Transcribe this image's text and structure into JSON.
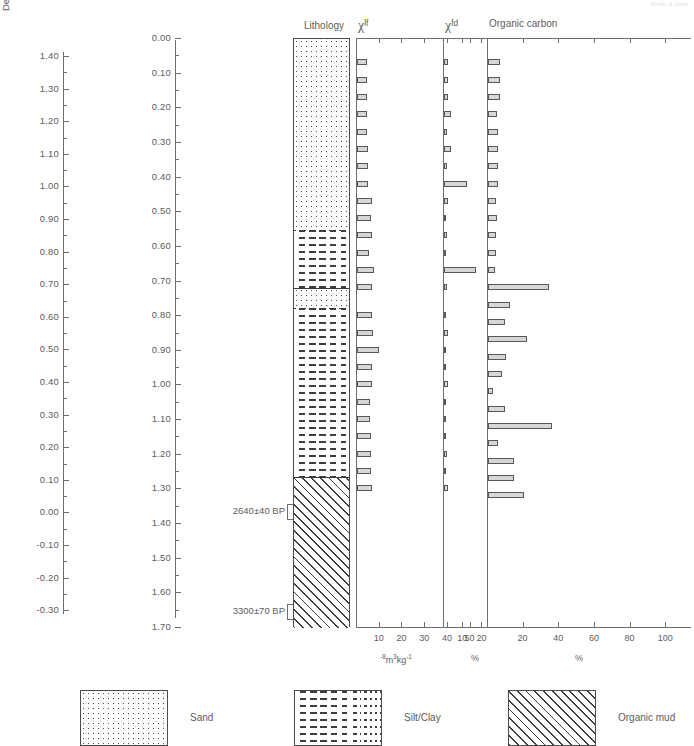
{
  "figure": {
    "corner_note": "Shelfy & Solm"
  },
  "axis_left": {
    "title": "Depth (m OD)",
    "ticks": [
      "1.40",
      "1.30",
      "1.20",
      "1.10",
      "1.00",
      "0.90",
      "0.80",
      "0.70",
      "0.60",
      "0.50",
      "0.40",
      "0.30",
      "0.20",
      "0.10",
      "0.00",
      "-0.10",
      "-0.20",
      "-0.30"
    ]
  },
  "axis_right": {
    "title": "Depth below datum (m)",
    "ticks": [
      "0.00",
      "0.10",
      "0.20",
      "0.30",
      "0.40",
      "0.50",
      "0.60",
      "0.70",
      "0.80",
      "0.90",
      "1.00",
      "1.10",
      "1.20",
      "1.30",
      "1.40",
      "1.50",
      "1.60",
      "1.70"
    ]
  },
  "lithology": {
    "title": "Lithology",
    "top_depth_m": 0.0,
    "bottom_depth_m": 1.7,
    "segments": [
      {
        "name": "Sand",
        "pattern": "sand",
        "from_m": 0.0,
        "to_m": 0.55
      },
      {
        "name": "Silt/Clay",
        "pattern": "silt",
        "from_m": 0.55,
        "to_m": 0.72
      },
      {
        "name": "Sand",
        "pattern": "sand",
        "from_m": 0.72,
        "to_m": 0.775
      },
      {
        "name": "Silt/Clay",
        "pattern": "silt",
        "from_m": 0.775,
        "to_m": 1.265
      },
      {
        "name": "Organic mud",
        "pattern": "organic",
        "from_m": 1.265,
        "to_m": 1.7
      }
    ],
    "radiocarbon_dates": [
      {
        "label": "2640±40 BP",
        "depth_m": 1.365
      },
      {
        "label": "3300±70 BP",
        "depth_m": 1.655
      }
    ]
  },
  "chart_data": [
    {
      "type": "bar",
      "id": "chi-lf",
      "title": "χlf",
      "title_main": "χ",
      "title_sup": "lf",
      "xlabel": "10⁻⁸m³kg⁻¹",
      "ylabel": "Depth below datum (m)",
      "orientation": "horizontal",
      "xlim": [
        0,
        55
      ],
      "xticks": [
        10,
        20,
        30,
        40,
        50
      ],
      "xticklabels": [
        "10",
        "20",
        "30",
        "40",
        "50"
      ],
      "grid": false,
      "depths_m": [
        0.07,
        0.12,
        0.17,
        0.22,
        0.27,
        0.32,
        0.37,
        0.42,
        0.47,
        0.52,
        0.57,
        0.62,
        0.67,
        0.72,
        0.8,
        0.85,
        0.9,
        0.95,
        1.0,
        1.05,
        1.1,
        1.15,
        1.2,
        1.25,
        1.3
      ],
      "values": [
        4.2,
        4.4,
        4.6,
        4.5,
        4.4,
        4.7,
        4.8,
        5.0,
        6.4,
        6.2,
        6.6,
        5.1,
        7.4,
        6.4,
        6.6,
        7.2,
        9.6,
        6.5,
        6.8,
        5.9,
        5.8,
        6.2,
        6.3,
        6.1,
        6.6
      ]
    },
    {
      "type": "bar",
      "id": "chi-fd",
      "title": "χfd",
      "title_main": "χ",
      "title_sup": "fd",
      "xlabel": "%",
      "ylabel": "Depth below datum (m)",
      "orientation": "horizontal",
      "xlim": [
        0,
        26
      ],
      "xticks": [
        10,
        20
      ],
      "xticklabels": [
        "10",
        "20"
      ],
      "grid": false,
      "depths_m": [
        0.07,
        0.12,
        0.17,
        0.22,
        0.27,
        0.32,
        0.37,
        0.42,
        0.47,
        0.52,
        0.57,
        0.62,
        0.67,
        0.72,
        0.8,
        0.85,
        0.9,
        0.95,
        1.0,
        1.05,
        1.1,
        1.15,
        1.2,
        1.25,
        1.3
      ],
      "values": [
        2.1,
        2.0,
        2.3,
        3.4,
        1.6,
        3.6,
        1.4,
        12.0,
        1.9,
        1.1,
        1.5,
        0.9,
        16.5,
        1.3,
        0.8,
        2.0,
        0.7,
        0.5,
        2.3,
        0.5,
        1.1,
        0.4,
        1.8,
        0.6,
        1.9
      ]
    },
    {
      "type": "bar",
      "id": "organic-carbon",
      "title": "Organic carbon",
      "xlabel": "%",
      "ylabel": "Depth below datum (m)",
      "orientation": "horizontal",
      "xlim": [
        0,
        110
      ],
      "xticks": [
        20,
        40,
        60,
        80,
        100
      ],
      "xticklabels": [
        "20",
        "40",
        "60",
        "80",
        "100"
      ],
      "grid": false,
      "depths_m": [
        0.07,
        0.12,
        0.17,
        0.22,
        0.27,
        0.32,
        0.37,
        0.42,
        0.47,
        0.52,
        0.57,
        0.62,
        0.67,
        0.72,
        0.77,
        0.82,
        0.87,
        0.92,
        0.97,
        1.02,
        1.07,
        1.12,
        1.17,
        1.22,
        1.27,
        1.32
      ],
      "values": [
        6.5,
        6.8,
        6.6,
        4.8,
        5.6,
        5.5,
        5.8,
        5.6,
        4.5,
        5.0,
        4.6,
        4.4,
        4.0,
        34.0,
        12.5,
        9.5,
        22.0,
        10.0,
        8.0,
        3.0,
        9.5,
        36.0,
        5.5,
        14.5,
        14.5,
        20.0
      ]
    }
  ],
  "legend": {
    "items": [
      {
        "label": "Sand",
        "pattern": "sand"
      },
      {
        "label": "Silt/Clay",
        "pattern": "silt"
      },
      {
        "label": "Organic mud",
        "pattern": "organic"
      }
    ]
  }
}
